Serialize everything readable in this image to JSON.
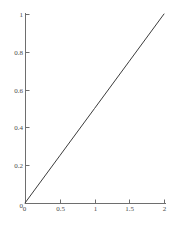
{
  "chart_data": {
    "type": "line",
    "title": "",
    "subtitle": "",
    "xlabel": "",
    "ylabel": "",
    "xlim": [
      0,
      2
    ],
    "ylim": [
      0,
      1
    ],
    "grid": false,
    "legend": null,
    "x_ticks": [
      {
        "value": 0,
        "label": "0"
      },
      {
        "value": 0.5,
        "label": "0.5"
      },
      {
        "value": 1,
        "label": "1"
      },
      {
        "value": 1.5,
        "label": "1.5"
      },
      {
        "value": 2,
        "label": "2"
      }
    ],
    "y_ticks": [
      {
        "value": 0,
        "label": "0"
      },
      {
        "value": 0.2,
        "label": "0.2"
      },
      {
        "value": 0.4,
        "label": "0.4"
      },
      {
        "value": 0.6,
        "label": "0.6"
      },
      {
        "value": 0.8,
        "label": "0.8"
      },
      {
        "value": 1,
        "label": "1"
      }
    ],
    "series": [
      {
        "name": "line",
        "x": [
          0,
          0.5,
          1,
          1.5,
          2
        ],
        "values": [
          0,
          0.25,
          0.5,
          0.75,
          1
        ],
        "color": "#3c3c3c",
        "width": 1
      }
    ],
    "axis_color": "#6e6e6e",
    "background": "#ffffff"
  },
  "labels": {
    "x": [
      "0",
      "0.5",
      "1",
      "1.5",
      "2"
    ],
    "y": [
      "0",
      "0.2",
      "0.4",
      "0.6",
      "0.8",
      "1"
    ]
  }
}
